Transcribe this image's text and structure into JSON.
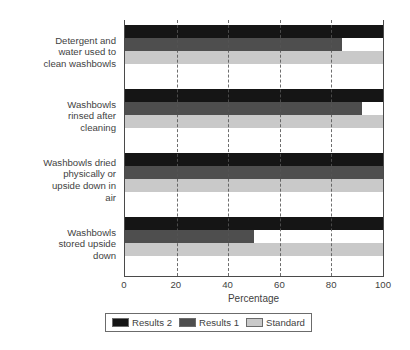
{
  "chart_data": {
    "type": "bar",
    "orientation": "horizontal",
    "title": "",
    "xlabel": "Percentage",
    "ylabel": "",
    "xlim": [
      0,
      100
    ],
    "xticks": [
      0,
      20,
      40,
      60,
      80,
      100
    ],
    "xticklabels": [
      "0",
      "20",
      "40",
      "60",
      "80",
      "100"
    ],
    "grid": "vertical-dashed",
    "legend_position": "below-axes",
    "categories": [
      "Detergent and water used to clean washbowls",
      "Washbowls rinsed after cleaning",
      "Washbowls dried physically or upside down in air",
      "Washbowls stored upside down"
    ],
    "category_lines": [
      [
        "Detergent and",
        "water used to",
        "clean washbowls"
      ],
      [
        "Washbowls",
        "rinsed after",
        "cleaning"
      ],
      [
        "Washbowls dried",
        "physically or",
        "upside down in",
        "air"
      ],
      [
        "Washbowls",
        "stored upside",
        "down"
      ]
    ],
    "series": [
      {
        "name": "Results 2",
        "color": "#151515",
        "values": [
          100,
          100,
          100,
          100
        ]
      },
      {
        "name": "Results 1",
        "color": "#4e4e4e",
        "values": [
          84,
          92,
          100,
          50
        ]
      },
      {
        "name": "Standard",
        "color": "#c9c9c9",
        "values": [
          100,
          100,
          100,
          100
        ]
      }
    ]
  },
  "legend": {
    "entries": [
      {
        "label": "Results 2"
      },
      {
        "label": "Results 1"
      },
      {
        "label": "Standard"
      }
    ]
  },
  "axis": {
    "x_title": "Percentage"
  }
}
